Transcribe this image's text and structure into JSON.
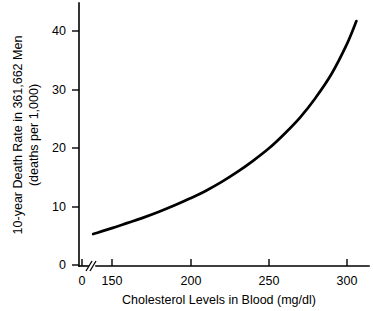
{
  "chart_data": {
    "type": "line",
    "title": "",
    "xlabel": "Cholesterol Levels in Blood (mg/dl)",
    "ylabel_line1": "10-year Death Rate in 361,662 Men",
    "ylabel_line2": "(deaths per 1,000)",
    "xlim": [
      130,
      308
    ],
    "ylim": [
      0,
      44
    ],
    "grid": false,
    "legend": null,
    "axis_break": {
      "axis": "x",
      "label": "//",
      "between": [
        0,
        130
      ]
    },
    "xticks": [
      "0",
      "150",
      "200",
      "250",
      "300"
    ],
    "xtick_values": [
      0,
      150,
      200,
      250,
      300
    ],
    "yticks": [
      "0",
      "10",
      "20",
      "30",
      "40"
    ],
    "ytick_values": [
      0,
      10,
      20,
      30,
      40
    ],
    "series": [
      {
        "name": "10-year death rate",
        "x": [
          138,
          150,
          160,
          170,
          180,
          190,
          200,
          210,
          220,
          230,
          240,
          250,
          260,
          270,
          280,
          290,
          300,
          306
        ],
        "values": [
          5.3,
          6.3,
          7.2,
          8.1,
          9.1,
          10.2,
          11.4,
          12.7,
          14.2,
          15.9,
          17.8,
          19.9,
          22.4,
          25.2,
          28.6,
          32.6,
          37.8,
          41.7
        ]
      }
    ],
    "colors": {
      "curve": "#000000",
      "axis": "#000000",
      "background": "#ffffff"
    }
  }
}
